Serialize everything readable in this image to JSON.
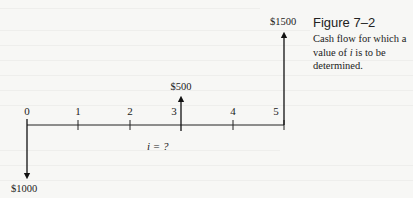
{
  "figure": {
    "title": "Figure 7–2",
    "caption": "Cash flow for which a value of i is to be determined.",
    "caption_parts": {
      "before": "Cash flow for which a value of ",
      "italic": "i",
      "after": " is to be determined."
    }
  },
  "diagram": {
    "type": "cash-flow-diagram",
    "periods": [
      "0",
      "1",
      "2",
      "3",
      "4",
      "5"
    ],
    "rate_label": "i = ?",
    "cash_flows": [
      {
        "period": 0,
        "amount": -1000,
        "label": "$1000",
        "direction": "down"
      },
      {
        "period": 3,
        "amount": 500,
        "label": "$500",
        "direction": "up"
      },
      {
        "period": 5,
        "amount": 1500,
        "label": "$1500",
        "direction": "up"
      }
    ]
  }
}
